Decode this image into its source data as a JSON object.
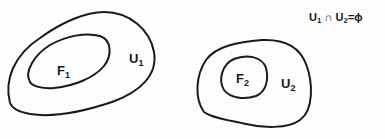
{
  "diagram": {
    "type": "set-diagram",
    "stroke_color": "#1a1a1a",
    "regions": [
      {
        "id": "U1",
        "label": "U",
        "subscript": "1",
        "role": "outer"
      },
      {
        "id": "F1",
        "label": "F",
        "subscript": "1",
        "role": "inner",
        "inside": "U1"
      },
      {
        "id": "U2",
        "label": "U",
        "subscript": "2",
        "role": "outer"
      },
      {
        "id": "F2",
        "label": "F",
        "subscript": "2",
        "role": "inner",
        "inside": "U2"
      }
    ],
    "equation": {
      "lhs_a": "U",
      "lhs_a_sub": "1",
      "op": "∩",
      "lhs_b": "U",
      "lhs_b_sub": "2",
      "eq": "=",
      "rhs": "ϕ"
    }
  }
}
